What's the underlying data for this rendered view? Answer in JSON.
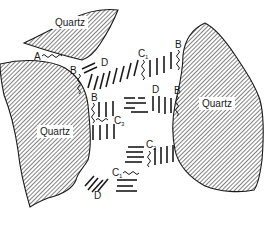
{
  "diagram": {
    "grains": [
      {
        "id": "top",
        "label": "Quartz"
      },
      {
        "id": "left",
        "label": "Quartz"
      },
      {
        "id": "right",
        "label": "Quartz"
      }
    ],
    "labels": {
      "A": "A",
      "B1": "B",
      "B2": "B",
      "B3": "B",
      "B4": "B",
      "C1a": "C",
      "C1a_sub": "1",
      "C1b": "C",
      "C1b_sub": "1",
      "C2": "C",
      "C2_sub": "2",
      "C3": "C",
      "C3_sub": "3",
      "D1": "D",
      "D2": "D",
      "D3": "D"
    },
    "colors": {
      "ink": "#1a1a1a",
      "background": "#ffffff"
    }
  }
}
